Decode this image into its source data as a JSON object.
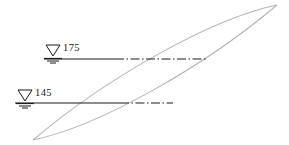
{
  "diagram": {
    "type": "engineering-section-diagram",
    "background_color": "#ffffff",
    "curve_color": "#b4b4b4",
    "line_color": "#1a1a1a",
    "text_color": "#1a1a1a",
    "water_levels": [
      {
        "id": "upper",
        "label": "175",
        "symbol": "water-table-triangle",
        "symbol_x": 53,
        "symbol_y": 51,
        "line_y": 59,
        "line_start_x": 44,
        "line_solid_end_x": 114,
        "line_end_x": 208
      },
      {
        "id": "lower",
        "label": "145",
        "symbol": "water-table-triangle",
        "symbol_x": 25,
        "symbol_y": 96,
        "line_y": 103,
        "line_start_x": 15,
        "line_solid_end_x": 120,
        "line_end_x": 172
      }
    ],
    "lens": {
      "upper_curve": "M 33 140 C 95 128, 200 70, 277 5",
      "lower_curve": "M 277 5 C 215 20, 110 78, 33 140",
      "tip_left": {
        "x": 33,
        "y": 140
      },
      "tip_right": {
        "x": 277,
        "y": 5
      }
    }
  }
}
